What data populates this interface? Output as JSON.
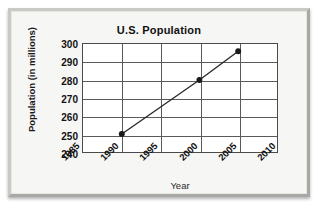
{
  "figure": {
    "title": "U.S. Population",
    "x_axis_title": "Year",
    "y_axis_title": "Population (in millions)",
    "line_color": "#2b2b2b",
    "marker_color": "#1a1a1a",
    "grid_color": "#5a5a5a",
    "panel_background": "#ffffff",
    "frame_background": "#f6f6f4"
  },
  "chart_data": {
    "type": "line",
    "title": "U.S. Population",
    "xlabel": "Year",
    "ylabel": "Population (in millions)",
    "xlim": [
      1985,
      2010
    ],
    "ylim": [
      240,
      300
    ],
    "xticks": [
      1985,
      1990,
      1995,
      2000,
      2005,
      2010
    ],
    "xtick_labels": [
      "1985",
      "1990",
      "1995",
      "2000",
      "2005",
      "2010"
    ],
    "yticks": [
      240,
      250,
      260,
      270,
      280,
      290,
      300
    ],
    "ytick_labels": [
      "240",
      "250",
      "260",
      "270",
      "280",
      "290",
      "300"
    ],
    "grid": true,
    "legend": false,
    "series": [
      {
        "name": "U.S. Population",
        "x": [
          1990,
          2000,
          2005
        ],
        "values": [
          250,
          280,
          296
        ],
        "marker": "circle"
      }
    ]
  }
}
